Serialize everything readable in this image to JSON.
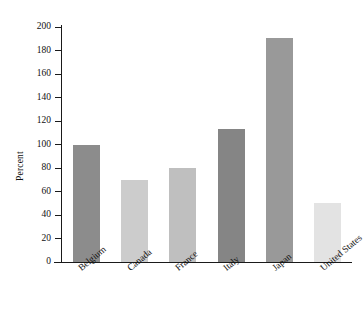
{
  "chart_data": {
    "type": "bar",
    "title": "",
    "xlabel": "",
    "ylabel": "Percent",
    "categories": [
      "Belgium",
      "Canada",
      "France",
      "Italy",
      "Japan",
      "United States"
    ],
    "values": [
      100,
      70,
      80,
      113,
      191,
      50
    ],
    "bar_colors": [
      "#8c8c8c",
      "#cccccc",
      "#bfbfbf",
      "#858585",
      "#999999",
      "#e3e3e3"
    ],
    "ylim": [
      0,
      200
    ],
    "ytick_labels": [
      "200",
      "180",
      "160",
      "140",
      "120",
      "100",
      "80",
      "60",
      "40",
      "20",
      "0"
    ],
    "ytick_values": [
      200,
      180,
      160,
      140,
      120,
      100,
      80,
      60,
      40,
      20,
      0
    ],
    "grid": false,
    "legend": false,
    "legend_position": "none",
    "axis_color": "#1a1a1a",
    "background_color": "#ffffff",
    "text_color": "#111111"
  }
}
